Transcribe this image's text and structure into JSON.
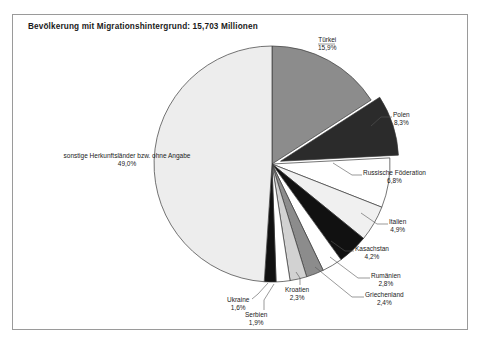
{
  "figure": {
    "title": "Bevölkerung mit Migrationshintergrund: 15,703 Millionen",
    "frame_color": "#9a9a9a",
    "background": "#ffffff"
  },
  "chart_data": {
    "type": "pie",
    "title": "Bevölkerung mit Migrationshintergrund: 15,703 Millionen",
    "total_label": "15,703 Millionen",
    "unit": "%",
    "start_angle_deg": 0,
    "direction": "clockwise",
    "legend": "none (direct labels with leader lines)",
    "categories": [
      "Türkei",
      "Polen",
      "Russische Föderation",
      "Italien",
      "Kasachstan",
      "Rumänien",
      "Griechenland",
      "Kroatien",
      "Serbien",
      "Ukraine",
      "sonstige Herkunftsländer bzw. ohne Angabe"
    ],
    "values": [
      15.9,
      8.3,
      6.8,
      4.9,
      4.2,
      2.8,
      2.4,
      2.3,
      1.9,
      1.6,
      49.0
    ],
    "value_labels": [
      "15,9%",
      "8,3%",
      "6,8%",
      "4,9%",
      "4,2%",
      "2,8%",
      "2,4%",
      "2,3%",
      "1,9%",
      "1,6%",
      "49,0%"
    ],
    "colors": [
      "#8c8c8c",
      "#2b2b2b",
      "#ffffff",
      "#f0f0f0",
      "#111111",
      "#ffffff",
      "#8c8c8c",
      "#d2d2d2",
      "#ffffff",
      "#111111",
      "#ededed"
    ],
    "exploded": [
      false,
      true,
      false,
      false,
      false,
      false,
      false,
      false,
      false,
      false,
      false
    ]
  },
  "labels": {
    "tuerkei": {
      "name": "Türkei",
      "pct": "15,9%"
    },
    "polen": {
      "name": "Polen",
      "pct": "8,3%"
    },
    "russische": {
      "name": "Russische Föderation",
      "pct": "6,8%"
    },
    "italien": {
      "name": "Italien",
      "pct": "4,9%"
    },
    "kasachstan": {
      "name": "Kasachstan",
      "pct": "4,2%"
    },
    "rumaenien": {
      "name": "Rumänien",
      "pct": "2,8%"
    },
    "griechenland": {
      "name": "Griechenland",
      "pct": "2,4%"
    },
    "kroatien": {
      "name": "Kroatien",
      "pct": "2,3%"
    },
    "serbien": {
      "name": "Serbien",
      "pct": "1,9%"
    },
    "ukraine": {
      "name": "Ukraine",
      "pct": "1,6%"
    },
    "sonstige": {
      "name": "sonstige Herkunftsländer bzw. ohne Angabe",
      "pct": "49,0%"
    }
  }
}
